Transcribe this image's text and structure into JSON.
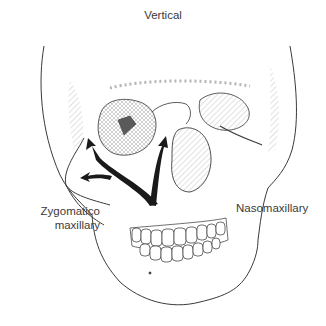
{
  "diagram": {
    "labels": {
      "top": "Vertical",
      "left_line1": "Zygomatico",
      "left_line2": "maxillary",
      "right": "Nasomaxillary"
    },
    "arrows": [
      {
        "name": "zygomaticomaxillary-vertical-arrow",
        "direction": "up"
      },
      {
        "name": "zygomaticomaxillary-lateral-arrow",
        "direction": "up-left"
      },
      {
        "name": "nasomaxillary-arrow",
        "direction": "up-right"
      }
    ],
    "colors": {
      "line": "#3a3a3a",
      "hatch": "#9a9a9a",
      "arrow": "#1a1a1a",
      "background": "#ffffff"
    }
  }
}
